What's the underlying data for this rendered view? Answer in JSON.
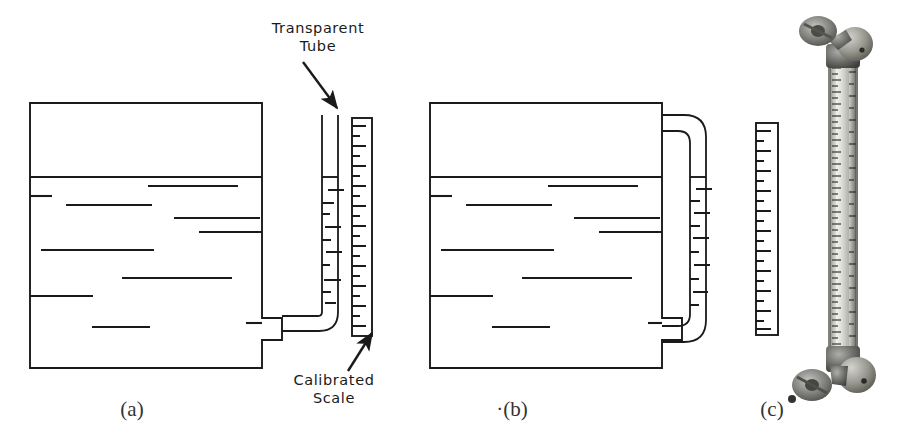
{
  "figure": {
    "title_present": false,
    "background_color": "#ffffff",
    "ink_color": "#1a1a1a",
    "annotations": [
      {
        "id": "transparent-tube",
        "line1": "Transparent",
        "line2": "Tube",
        "text_x": 318,
        "text_y": 33,
        "arrow": {
          "x1": 303,
          "y1": 62,
          "x2": 337,
          "y2": 108
        }
      },
      {
        "id": "calibrated-scale",
        "line1": "Calibrated",
        "line2": "Scale",
        "text_x": 334,
        "text_y": 385,
        "arrow": {
          "x1": 350,
          "y1": 372,
          "x2": 372,
          "y2": 334
        }
      }
    ],
    "captions": [
      {
        "id": "caption-a",
        "label": "(a)",
        "x": 132,
        "y": 416
      },
      {
        "id": "caption-b",
        "label": "·(b)",
        "x": 512,
        "y": 416
      },
      {
        "id": "caption-c",
        "label": "(c)",
        "x": 772,
        "y": 416
      }
    ],
    "panels": [
      {
        "id": "panel-a",
        "caption": "(a)",
        "kind": "diagram",
        "description": "Tank with external transparent sight tube routed from bottom outlet up alongside a calibrated scale",
        "tank": {
          "x": 30,
          "y": 103,
          "width": 232,
          "height": 265,
          "liquid_surface_y": 177,
          "outlet": {
            "x": 262,
            "y": 318,
            "width": 20,
            "height": 22
          }
        },
        "tube": {
          "top_y": 115,
          "left_x": 322,
          "right_x": 338,
          "bottom_y": 330,
          "liquid_level_y": 177,
          "shape": "vertical-with-bottom-elbow-to-tank"
        },
        "scale": {
          "x": 352,
          "y": 118,
          "width": 20,
          "height": 218,
          "tick_count": 22,
          "tick_pattern": "alternating-long-short",
          "tick_side": "left"
        },
        "liquid_dashes": [
          {
            "x": 30,
            "y": 196,
            "w": 22
          },
          {
            "x": 148,
            "y": 186,
            "w": 90
          },
          {
            "x": 66,
            "y": 205,
            "w": 86
          },
          {
            "x": 174,
            "y": 218,
            "w": 86
          },
          {
            "x": 199,
            "y": 232,
            "w": 78
          },
          {
            "x": 231,
            "y": 211,
            "w": 44
          },
          {
            "x": 41,
            "y": 250,
            "w": 113
          },
          {
            "x": 122,
            "y": 278,
            "w": 110
          },
          {
            "x": 30,
            "y": 296,
            "w": 63
          },
          {
            "x": 92,
            "y": 327,
            "w": 58
          },
          {
            "x": 255,
            "y": 323,
            "w": 16
          }
        ]
      },
      {
        "id": "panel-b",
        "caption": "(b)",
        "kind": "diagram",
        "description": "Tank with external U-bend transparent tube loop and a separate calibrated scale alongside",
        "tank": {
          "x": 430,
          "y": 103,
          "width": 232,
          "height": 265,
          "liquid_surface_y": 177,
          "outlet": {
            "x": 662,
            "y": 318,
            "width": 20,
            "height": 22
          }
        },
        "tube": {
          "top_y": 115,
          "left_x": 672,
          "right_x": 700,
          "bottom_y": 340,
          "liquid_level_y": 177,
          "shape": "u-bend-loop"
        },
        "scale": {
          "x": 756,
          "y": 123,
          "width": 22,
          "height": 212,
          "tick_count": 22,
          "tick_pattern": "alternating-long-short",
          "tick_side": "left"
        },
        "liquid_dashes": [
          {
            "x": 430,
            "y": 196,
            "w": 22
          },
          {
            "x": 548,
            "y": 186,
            "w": 90
          },
          {
            "x": 466,
            "y": 205,
            "w": 86
          },
          {
            "x": 574,
            "y": 218,
            "w": 86
          },
          {
            "x": 599,
            "y": 232,
            "w": 78
          },
          {
            "x": 631,
            "y": 211,
            "w": 32
          },
          {
            "x": 441,
            "y": 250,
            "w": 113
          },
          {
            "x": 522,
            "y": 278,
            "w": 110
          },
          {
            "x": 430,
            "y": 296,
            "w": 63
          },
          {
            "x": 492,
            "y": 327,
            "w": 58
          },
          {
            "x": 648,
            "y": 323,
            "w": 14
          }
        ]
      },
      {
        "id": "panel-c",
        "caption": "(c)",
        "kind": "photograph",
        "description": "Photograph of a real armored tubular sight glass level gauge with valved end fittings top and bottom and a graduated scale strip",
        "body": {
          "x": 830,
          "y": 62,
          "width": 26,
          "height": 290
        },
        "top_fitting": {
          "x": 800,
          "y": 14,
          "width": 72,
          "height": 52
        },
        "bottom_fitting": {
          "x": 798,
          "y": 348,
          "width": 74,
          "height": 54
        },
        "scale_strip": {
          "x": 836,
          "y": 66,
          "width": 14,
          "height": 282,
          "tick_count": 44,
          "tick_side": "both"
        }
      }
    ]
  }
}
